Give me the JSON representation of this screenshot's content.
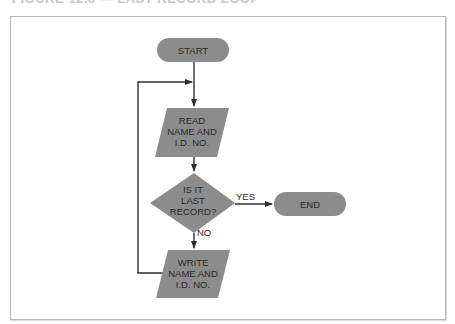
{
  "caption": "FIGURE 12.6 — LAST RECORD LOOP",
  "colors": {
    "shape_fill": "#8c8c8c",
    "line": "#2e2e2e",
    "frame": "#b8b8b8",
    "text": "#2a2a2a"
  },
  "flowchart": {
    "nodes": [
      {
        "id": "start",
        "type": "terminal",
        "label": "START"
      },
      {
        "id": "read",
        "type": "input-output",
        "lines": [
          "READ",
          "NAME AND",
          "I.D. NO."
        ]
      },
      {
        "id": "decision",
        "type": "decision",
        "lines": [
          "IS IT",
          "LAST",
          "RECORD?"
        ]
      },
      {
        "id": "end",
        "type": "terminal",
        "label": "END"
      },
      {
        "id": "write",
        "type": "input-output",
        "lines": [
          "WRITE",
          "NAME AND",
          "I.D. NO."
        ]
      }
    ],
    "edges": [
      {
        "from": "start",
        "to": "read",
        "label": ""
      },
      {
        "from": "read",
        "to": "decision",
        "label": ""
      },
      {
        "from": "decision",
        "to": "end",
        "label": "YES"
      },
      {
        "from": "decision",
        "to": "write",
        "label": "NO"
      },
      {
        "from": "write",
        "to": "read",
        "label": "",
        "note": "loop back"
      }
    ]
  }
}
